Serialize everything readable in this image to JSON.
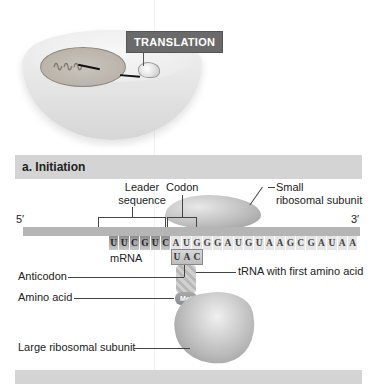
{
  "cell_illustration": {
    "label": "TRANSLATION"
  },
  "sections": [
    {
      "id": "initiation",
      "title": "a. Initiation"
    },
    {
      "id": "next",
      "title": "b. Elongation"
    }
  ],
  "mrna": {
    "five_prime": "5′",
    "three_prime": "3′",
    "label": "mRNA",
    "bases": [
      "U",
      "U",
      "C",
      "G",
      "U",
      "C",
      "A",
      "U",
      "G",
      "G",
      "G",
      "A",
      "U",
      "G",
      "U",
      "A",
      "A",
      "G",
      "C",
      "G",
      "A",
      "U",
      "A",
      "A"
    ]
  },
  "anticodon_bases": [
    "U",
    "A",
    "C"
  ],
  "amino_acid_tag": "Met",
  "labels": {
    "leader_sequence_line1": "Leader",
    "leader_sequence_line2": "sequence",
    "codon": "Codon",
    "small_subunit_line1": "Small",
    "small_subunit_line2": "ribosomal subunit",
    "anticodon": "Anticodon",
    "trna": "tRNA with first amino acid",
    "amino_acid": "Amino acid",
    "large_subunit": "Large ribosomal subunit"
  }
}
